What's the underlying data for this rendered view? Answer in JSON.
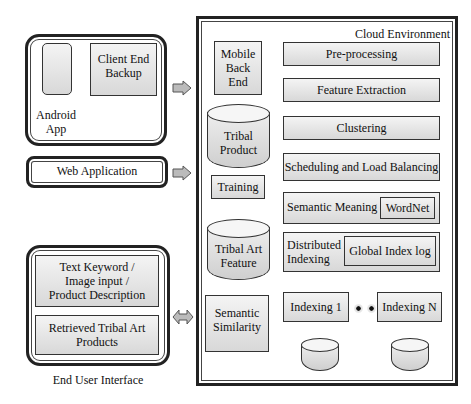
{
  "client": {
    "android_box": {
      "device_label": "Android\nApp",
      "backup_label": "Client End\nBackup"
    },
    "web_app_label": "Web Application",
    "end_user": {
      "input_label": "Text Keyword /\nImage input /\nProduct Description",
      "output_label": "Retrieved Tribal Art\nProducts",
      "caption": "End User Interface"
    }
  },
  "cloud": {
    "title": "Cloud Environment",
    "left_column": {
      "mobile_backend": "Mobile\nBack\nEnd",
      "tribal_product": "Tribal\nProduct",
      "training": "Training",
      "tribal_art_feature": "Tribal Art\nFeature",
      "semantic_similarity": "Semantic\nSimilarity"
    },
    "pipeline": {
      "preprocessing": "Pre-processing",
      "feature_extraction": "Feature Extraction",
      "clustering": "Clustering",
      "scheduling": "Scheduling and Load Balancing",
      "semantic_meaning": "Semantic Meaning",
      "wordnet": "WordNet",
      "distributed_indexing": "Distributed\nIndexing",
      "global_index_log": "Global Index log",
      "indexing_1": "Indexing 1",
      "indexing_n": "Indexing N"
    }
  }
}
